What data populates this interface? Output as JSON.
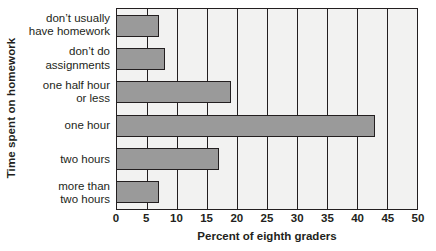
{
  "chart_data": {
    "type": "bar",
    "orientation": "horizontal",
    "title": "",
    "xlabel": "Percent of eighth graders",
    "ylabel": "Time spent on homework",
    "categories": [
      "don't usually\nhave homework",
      "don't do\nassignments",
      "one half hour\nor less",
      "one hour",
      "two hours",
      "more than\ntwo hours"
    ],
    "category_lines": [
      [
        "don’t usually",
        "have homework"
      ],
      [
        "don’t do",
        "assignments"
      ],
      [
        "one half hour",
        "or less"
      ],
      [
        "one hour"
      ],
      [
        "two hours"
      ],
      [
        "more than",
        "two hours"
      ]
    ],
    "values": [
      7,
      8,
      19,
      43,
      17,
      7
    ],
    "xlim": [
      0,
      50
    ],
    "xticks": [
      0,
      5,
      10,
      15,
      20,
      25,
      30,
      35,
      40,
      45,
      50
    ],
    "xtick_labels": [
      "0",
      "5",
      "10",
      "15",
      "20",
      "25",
      "30",
      "35",
      "40",
      "45",
      "50"
    ],
    "grid": "vertical",
    "legend": null,
    "colors": {
      "bar_fill": "#9a9a9a",
      "bar_stroke": "#231f20",
      "plot_background": "#f2f2f1",
      "axis": "#231f20",
      "text": "#231f20",
      "page_background": "#ffffff"
    }
  }
}
